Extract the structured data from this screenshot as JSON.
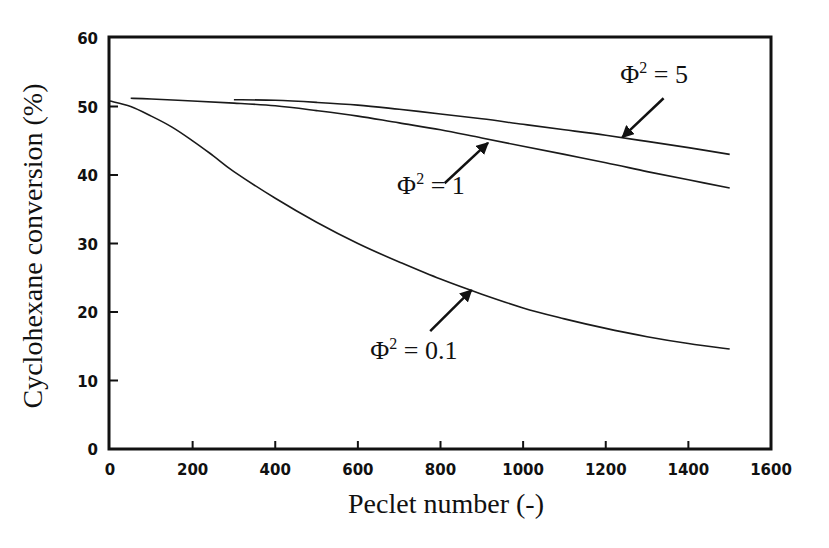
{
  "chart_data": {
    "type": "line",
    "title": "",
    "xlabel": "Peclet number (-)",
    "ylabel": "Cyclohexane conversion (%)",
    "xlim": [
      0,
      1600
    ],
    "ylim": [
      0,
      60
    ],
    "xticks": [
      0,
      200,
      400,
      600,
      800,
      1000,
      1200,
      1400,
      1600
    ],
    "yticks": [
      0,
      10,
      20,
      30,
      40,
      50,
      60
    ],
    "grid": false,
    "legend": "none (inline annotations with arrows)",
    "series": [
      {
        "name": "Φ² = 0.1",
        "x": [
          0,
          50,
          100,
          150,
          200,
          250,
          300,
          400,
          500,
          600,
          700,
          800,
          900,
          1000,
          1100,
          1200,
          1300,
          1400,
          1500
        ],
        "values": [
          50.8,
          50.0,
          48.6,
          47.0,
          45.0,
          42.8,
          40.5,
          36.6,
          33.1,
          30.0,
          27.3,
          24.8,
          22.6,
          20.6,
          19.0,
          17.6,
          16.4,
          15.4,
          14.6
        ]
      },
      {
        "name": "Φ² = 1",
        "x": [
          50,
          100,
          200,
          300,
          400,
          500,
          600,
          700,
          800,
          900,
          1000,
          1100,
          1200,
          1300,
          1400,
          1500
        ],
        "values": [
          51.2,
          51.1,
          50.8,
          50.5,
          50.1,
          49.4,
          48.6,
          47.6,
          46.6,
          45.4,
          44.2,
          43.0,
          41.8,
          40.5,
          39.3,
          38.1
        ]
      },
      {
        "name": "Φ² = 5",
        "x": [
          300,
          400,
          500,
          600,
          700,
          800,
          900,
          1000,
          1100,
          1200,
          1300,
          1400,
          1500
        ],
        "values": [
          51.0,
          50.9,
          50.6,
          50.2,
          49.6,
          48.9,
          48.2,
          47.4,
          46.6,
          45.8,
          44.9,
          44.0,
          43.0
        ]
      }
    ],
    "annotations": [
      {
        "text_base": "Φ",
        "text_sup": "2",
        "text_rest": " = 5",
        "label_x": 1235,
        "label_y": 53.5,
        "arrow_from": [
          1340,
          51.2
        ],
        "arrow_to": [
          1240,
          45.5
        ]
      },
      {
        "text_base": "Φ",
        "text_sup": "2",
        "text_rest": " = 1",
        "label_x": 695,
        "label_y": 37.2,
        "arrow_from": [
          810,
          38.8
        ],
        "arrow_to": [
          915,
          44.7
        ]
      },
      {
        "text_base": "Φ",
        "text_sup": "2",
        "text_rest": " = 0.1",
        "label_x": 630,
        "label_y": 13.2,
        "arrow_from": [
          775,
          17.2
        ],
        "arrow_to": [
          875,
          23.2
        ]
      }
    ]
  }
}
